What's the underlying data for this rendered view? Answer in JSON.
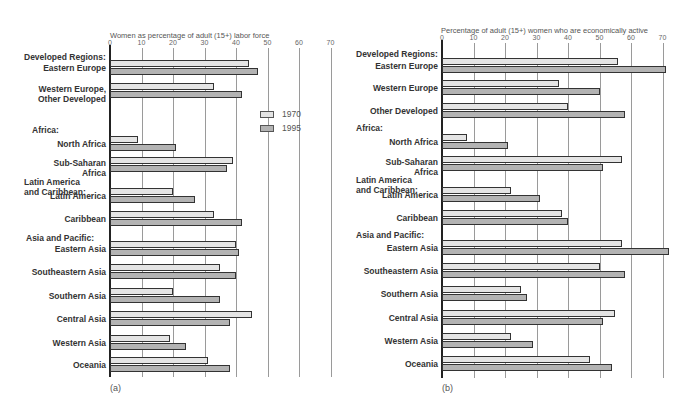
{
  "chart_data": [
    {
      "type": "bar",
      "orientation": "horizontal",
      "panel_label": "(a)",
      "title": "Women as percentage of adult (15+) labor force",
      "xlabel": "Women as percentage of adult (15+) labor force",
      "ylabel": "",
      "xlim": [
        0,
        70
      ],
      "xticks": [
        0,
        10,
        20,
        30,
        40,
        50,
        60,
        70
      ],
      "grid": true,
      "legend": {
        "position": "right-upper",
        "entries": [
          "1970",
          "1995"
        ]
      },
      "groups": [
        {
          "name": "Developed Regions:",
          "categories": [
            "Eastern Europe",
            "Western Europe, Other Developed"
          ]
        },
        {
          "name": "Africa:",
          "categories": [
            "North Africa",
            "Sub-Saharan Africa"
          ]
        },
        {
          "name": "Latin America and Caribbean:",
          "categories": [
            "Latin America",
            "Caribbean"
          ]
        },
        {
          "name": "Asia and Pacific:",
          "categories": [
            "Eastern Asia",
            "Southeastern Asia",
            "Southern Asia",
            "Central Asia",
            "Western Asia",
            "Oceania"
          ]
        }
      ],
      "categories": [
        "Eastern Europe",
        "Western Europe, Other Developed",
        "North Africa",
        "Sub-Saharan Africa",
        "Latin America",
        "Caribbean",
        "Eastern Asia",
        "Southeastern Asia",
        "Southern Asia",
        "Central Asia",
        "Western Asia",
        "Oceania"
      ],
      "series": [
        {
          "name": "1970",
          "color": "#e4e4e4",
          "values": [
            44,
            33,
            9,
            39,
            20,
            33,
            40,
            35,
            20,
            45,
            19,
            31
          ]
        },
        {
          "name": "1995",
          "color": "#b3b3b3",
          "values": [
            47,
            42,
            21,
            37,
            27,
            42,
            41,
            40,
            35,
            38,
            24,
            38
          ]
        }
      ]
    },
    {
      "type": "bar",
      "orientation": "horizontal",
      "panel_label": "(b)",
      "title": "Percentage of adult (15+) women who are economically active",
      "xlabel": "Percentage of adult (15+) women who are economically active",
      "ylabel": "",
      "xlim": [
        0,
        70
      ],
      "xticks": [
        0,
        10,
        20,
        30,
        40,
        50,
        60,
        70
      ],
      "grid": true,
      "legend": {
        "position": "shared with (a)",
        "entries": [
          "1970",
          "1995"
        ]
      },
      "groups": [
        {
          "name": "Developed Regions:",
          "categories": [
            "Eastern Europe",
            "Western Europe",
            "Other Developed"
          ]
        },
        {
          "name": "Africa:",
          "categories": [
            "North Africa",
            "Sub-Saharan Africa"
          ]
        },
        {
          "name": "Latin America and Caribbean:",
          "categories": [
            "Latin America",
            "Caribbean"
          ]
        },
        {
          "name": "Asia and Pacific:",
          "categories": [
            "Eastern Asia",
            "Southeastern Asia",
            "Southern Asia",
            "Central Asia",
            "Western Asia",
            "Oceania"
          ]
        }
      ],
      "categories": [
        "Eastern Europe",
        "Western Europe",
        "Other Developed",
        "North Africa",
        "Sub-Saharan Africa",
        "Latin America",
        "Caribbean",
        "Eastern Asia",
        "Southeastern Asia",
        "Southern Asia",
        "Central Asia",
        "Western Asia",
        "Oceania"
      ],
      "series": [
        {
          "name": "1970",
          "color": "#e4e4e4",
          "values": [
            56,
            37,
            40,
            8,
            57,
            22,
            38,
            57,
            50,
            25,
            55,
            22,
            47
          ]
        },
        {
          "name": "1995",
          "color": "#b3b3b3",
          "values": [
            71,
            50,
            58,
            21,
            51,
            31,
            40,
            72,
            58,
            27,
            51,
            29,
            54
          ]
        }
      ]
    }
  ],
  "panels": {
    "a": {
      "axis_title": "Women as percentage of adult (15+) labor force",
      "panel_label": "(a)",
      "ticks": [
        "0",
        "10",
        "20",
        "30",
        "40",
        "50",
        "60",
        "70"
      ],
      "groups": {
        "developed": "Developed Regions:",
        "africa": "Africa:",
        "latam": "Latin America\nand Caribbean:",
        "asia": "Asia and Pacific:"
      },
      "rows": [
        {
          "label": "Eastern Europe",
          "v1970": 44,
          "v1995": 47
        },
        {
          "label": "Western Europe,\nOther Developed",
          "v1970": 33,
          "v1995": 42
        },
        {
          "label": "North Africa",
          "v1970": 9,
          "v1995": 21
        },
        {
          "label": "Sub-Saharan\nAfrica",
          "v1970": 39,
          "v1995": 37
        },
        {
          "label": "Latin America",
          "v1970": 20,
          "v1995": 27
        },
        {
          "label": "Caribbean",
          "v1970": 33,
          "v1995": 42
        },
        {
          "label": "Eastern Asia",
          "v1970": 40,
          "v1995": 41
        },
        {
          "label": "Southeastern Asia",
          "v1970": 35,
          "v1995": 40
        },
        {
          "label": "Southern Asia",
          "v1970": 20,
          "v1995": 35
        },
        {
          "label": "Central Asia",
          "v1970": 45,
          "v1995": 38
        },
        {
          "label": "Western Asia",
          "v1970": 19,
          "v1995": 24
        },
        {
          "label": "Oceania",
          "v1970": 31,
          "v1995": 38
        }
      ],
      "legend": {
        "label_1970": "1970",
        "label_1995": "1995"
      }
    },
    "b": {
      "axis_title": "Percentage of adult (15+) women who are economically active",
      "panel_label": "(b)",
      "ticks": [
        "0",
        "10",
        "20",
        "30",
        "40",
        "50",
        "60",
        "70"
      ],
      "groups": {
        "developed": "Developed Regions:",
        "africa": "Africa:",
        "latam": "Latin America\nand Caribbean:",
        "asia": "Asia and Pacific:"
      },
      "rows": [
        {
          "label": "Eastern Europe",
          "v1970": 56,
          "v1995": 71
        },
        {
          "label": "Western Europe",
          "v1970": 37,
          "v1995": 50
        },
        {
          "label": "Other Developed",
          "v1970": 40,
          "v1995": 58
        },
        {
          "label": "North Africa",
          "v1970": 8,
          "v1995": 21
        },
        {
          "label": "Sub-Saharan\nAfrica",
          "v1970": 57,
          "v1995": 51
        },
        {
          "label": "Latin America",
          "v1970": 22,
          "v1995": 31
        },
        {
          "label": "Caribbean",
          "v1970": 38,
          "v1995": 40
        },
        {
          "label": "Eastern Asia",
          "v1970": 57,
          "v1995": 72
        },
        {
          "label": "Southeastern Asia",
          "v1970": 50,
          "v1995": 58
        },
        {
          "label": "Southern Asia",
          "v1970": 25,
          "v1995": 27
        },
        {
          "label": "Central Asia",
          "v1970": 55,
          "v1995": 51
        },
        {
          "label": "Western Asia",
          "v1970": 22,
          "v1995": 29
        },
        {
          "label": "Oceania",
          "v1970": 47,
          "v1995": 54
        }
      ]
    }
  }
}
